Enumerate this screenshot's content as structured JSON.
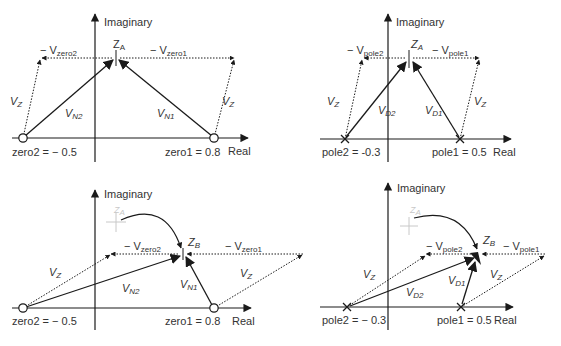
{
  "panels": [
    {
      "id": "top-left",
      "axis_y_label": "Imaginary",
      "axis_x_label": "Real",
      "point_label": "Z",
      "point_sub": "A",
      "zero2_label": "zero2 = − 0.5",
      "zero1_label": "zero1 = 0.8",
      "neg_v2_label": "− V",
      "neg_v2_sub": "zero2",
      "neg_v1_label": "− V",
      "neg_v1_sub": "zero1",
      "vz_label": "V",
      "vz_sub": "Z",
      "v2_label": "V",
      "v2_sub": "N2",
      "v1_label": "V",
      "v1_sub": "N1"
    },
    {
      "id": "top-right",
      "axis_y_label": "Imaginary",
      "axis_x_label": "Real",
      "point_label": "Z",
      "point_sub": "A",
      "pole2_label": "pole2 = -0.3",
      "pole1_label": "pole1 = 0.5",
      "neg_v2_label": "− V",
      "neg_v2_sub": "pole2",
      "neg_v1_label": "− V",
      "neg_v1_sub": "pole1",
      "vz_label": "V",
      "vz_sub": "Z",
      "v2_label": "V",
      "v2_sub": "D2",
      "v1_label": "V",
      "v1_sub": "D1"
    },
    {
      "id": "bottom-left",
      "axis_y_label": "Imaginary",
      "axis_x_label": "Real",
      "ghost_label": "Z",
      "ghost_sub": "A",
      "point_label": "Z",
      "point_sub": "B",
      "zero2_label": "zero2 = − 0.5",
      "zero1_label": "zero1 = 0.8",
      "neg_v2_label": "− V",
      "neg_v2_sub": "zero2",
      "neg_v1_label": "− V",
      "neg_v1_sub": "zero1",
      "vz_label": "V",
      "vz_sub": "Z",
      "v2_label": "V",
      "v2_sub": "N2",
      "v1_label": "V",
      "v1_sub": "N1"
    },
    {
      "id": "bottom-right",
      "axis_y_label": "Imaginary",
      "axis_x_label": "Real",
      "ghost_label": "Z",
      "ghost_sub": "A",
      "point_label": "Z",
      "point_sub": "B",
      "pole2_label": "pole2 = − 0.3",
      "pole1_label": "pole1 = 0.5",
      "neg_v2_label": "− V",
      "neg_v2_sub": "pole2",
      "neg_v1_label": "− V",
      "neg_v1_sub": "pole1",
      "vz_label": "V",
      "vz_sub": "Z",
      "v2_label": "V",
      "v2_sub": "D2",
      "v1_label": "V",
      "v1_sub": "D1"
    }
  ],
  "colors": {
    "line": "#1a1a1a",
    "ghost": "#c8c8c8",
    "text": "#333333"
  }
}
